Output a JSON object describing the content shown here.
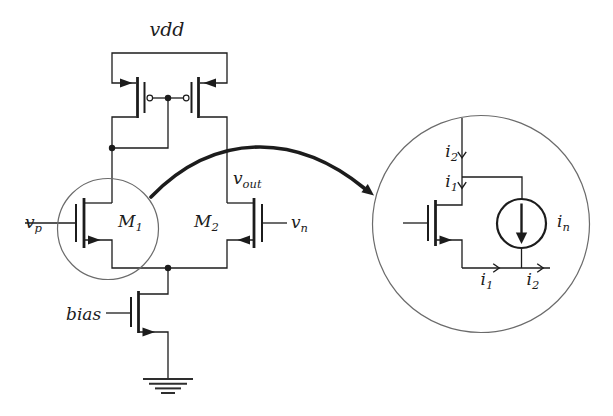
{
  "figure": {
    "colors": {
      "ink": "#1c1c1c",
      "annotation": "#6b6b6b",
      "background": "#ffffff"
    },
    "labels": {
      "vdd": {
        "base": "vdd",
        "sub": ""
      },
      "v_p": {
        "base": "v",
        "sub": "p"
      },
      "m1": {
        "base": "M",
        "sub": "1"
      },
      "m2": {
        "base": "M",
        "sub": "2"
      },
      "v_n": {
        "base": "v",
        "sub": "n"
      },
      "v_out": {
        "base": "v",
        "sub": "out"
      },
      "bias": {
        "base": "bias",
        "sub": ""
      },
      "detail": {
        "i2_top": {
          "base": "i",
          "sub": "2"
        },
        "i1_top": {
          "base": "i",
          "sub": "1"
        },
        "i_n": {
          "base": "i",
          "sub": "n"
        },
        "i1_bottom": {
          "base": "i",
          "sub": "1"
        },
        "i2_bottom": {
          "base": "i",
          "sub": "2"
        }
      }
    }
  }
}
